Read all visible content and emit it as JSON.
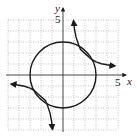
{
  "figure": {
    "axes": {
      "x_label": "x",
      "y_label": "y",
      "x_tick_label": "5",
      "y_tick_label": "5",
      "xlim": [
        -5,
        5
      ],
      "ylim": [
        -5,
        5
      ],
      "grid": "dotted, 1 unit spacing"
    },
    "curves": [
      {
        "name": "circle",
        "equation": "x^2 + y^2 = 9",
        "center": [
          0,
          0
        ],
        "radius": 3
      },
      {
        "name": "hyperbola",
        "equation": "xy = 4.5",
        "branches": [
          "quadrant I",
          "quadrant III"
        ]
      }
    ],
    "colors": {
      "curve": "#1a1a1a",
      "grid": "#9a9a9a",
      "axis": "#333333"
    }
  }
}
